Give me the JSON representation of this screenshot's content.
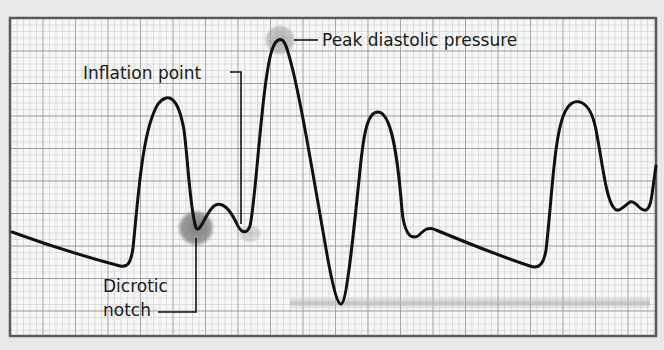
{
  "figure": {
    "type": "intra-aortic balloon pump arterial pressure waveform",
    "background_color": "#e9e9e9",
    "grid": {
      "paper_color": "#f7f7f7",
      "minor_line_color": "#bdbdbd",
      "major_line_color": "#8a8a8a",
      "border_color": "#5a5a5a",
      "minor_spacing_px": 6.5,
      "major_every": 5
    },
    "waveform_color": "#111111",
    "highlight_color": "#8c8c8c"
  },
  "annotations": {
    "peak_diastolic": {
      "text": "Peak diastolic pressure"
    },
    "inflation_point": {
      "text": "Inflation point"
    },
    "dicrotic_notch": {
      "line1": "Dicrotic",
      "line2": "notch"
    }
  }
}
